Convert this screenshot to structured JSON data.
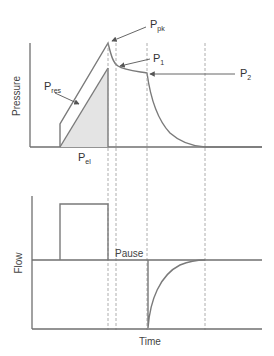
{
  "top_chart": {
    "y_label": "Pressure",
    "labels": {
      "p_pk": {
        "main": "P",
        "sub": "pk"
      },
      "p_1": {
        "main": "P",
        "sub": "1"
      },
      "p_2": {
        "main": "P",
        "sub": "2"
      },
      "p_res": {
        "main": "P",
        "sub": "res"
      },
      "p_el": {
        "main": "P",
        "sub": "el"
      }
    }
  },
  "bottom_chart": {
    "y_label": "Flow",
    "annotation": "Pause",
    "x_label": "Time"
  },
  "colors": {
    "line": "#7a7a7a",
    "fill": "#e4e4e4",
    "axis": "#6f6f6f"
  }
}
